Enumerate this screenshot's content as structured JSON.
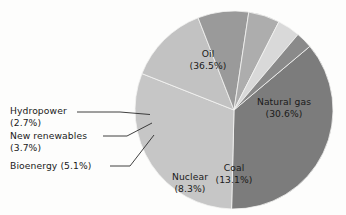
{
  "chart_data": {
    "type": "pie",
    "title": "",
    "subtitle": "",
    "xlabel": "",
    "ylabel": "",
    "legend_position": "none",
    "grid": false,
    "units": "percent",
    "total": 100.0,
    "start_angle_deg": -40,
    "direction": "clockwise",
    "categories": [
      "Oil",
      "Natural gas",
      "Coal",
      "Nuclear",
      "Bioenergy",
      "New renewables",
      "Hydropower"
    ],
    "values": [
      36.5,
      30.6,
      13.1,
      8.3,
      5.1,
      3.7,
      2.7
    ],
    "colors": [
      "#7c7c7c",
      "#c6c6c6",
      "#c2c2c2",
      "#9a9a9a",
      "#adadad",
      "#d9d9d9",
      "#8a8a8a"
    ],
    "slices": [
      {
        "name": "Oil",
        "value": 36.5,
        "label": "Oil",
        "percent_text": "(36.5%)",
        "color": "#7c7c7c",
        "label_placement": "inside"
      },
      {
        "name": "Natural gas",
        "value": 30.6,
        "label": "Natural gas",
        "percent_text": "(30.6%)",
        "color": "#c6c6c6",
        "label_placement": "inside"
      },
      {
        "name": "Coal",
        "value": 13.1,
        "label": "Coal",
        "percent_text": "(13.1%)",
        "color": "#c2c2c2",
        "label_placement": "inside"
      },
      {
        "name": "Nuclear",
        "value": 8.3,
        "label": "Nuclear",
        "percent_text": "(8.3%)",
        "color": "#9a9a9a",
        "label_placement": "inside"
      },
      {
        "name": "Bioenergy",
        "value": 5.1,
        "label": "Bioenergy (5.1%)",
        "percent_text": "(5.1%)",
        "color": "#adadad",
        "label_placement": "callout"
      },
      {
        "name": "New renewables",
        "value": 3.7,
        "label": "New renewables",
        "percent_text": "(3.7%)",
        "color": "#d9d9d9",
        "label_placement": "callout"
      },
      {
        "name": "Hydropower",
        "value": 2.7,
        "label": "Hydropower",
        "percent_text": "(2.7%)",
        "color": "#8a8a8a",
        "label_placement": "callout"
      }
    ]
  },
  "labels": {
    "oil_name": "Oil",
    "oil_pct": "(36.5%)",
    "natural_gas_name": "Natural gas",
    "natural_gas_pct": "(30.6%)",
    "coal_name": "Coal",
    "coal_pct": "(13.1%)",
    "nuclear_name": "Nuclear",
    "nuclear_pct": "(8.3%)",
    "hydropower_name": "Hydropower",
    "hydropower_pct": "(2.7%)",
    "new_renewables_name": "New renewables",
    "new_renewables_pct": "(3.7%)",
    "bioenergy_combined": "Bioenergy (5.1%)"
  }
}
